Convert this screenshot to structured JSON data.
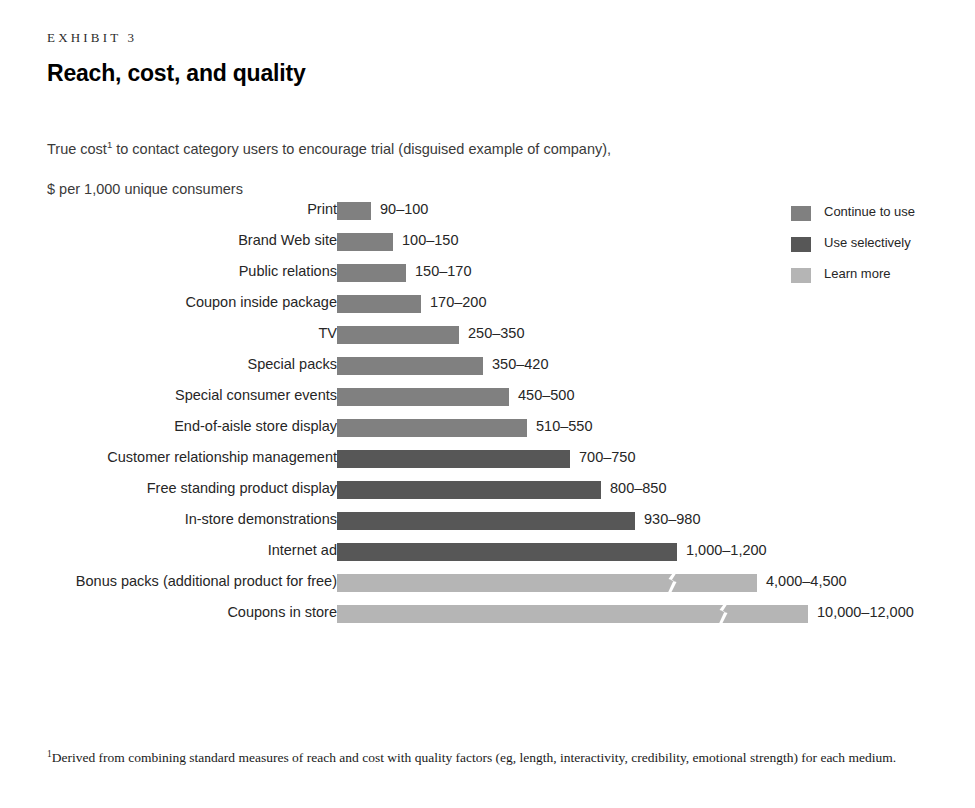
{
  "header": {
    "exhibit_label": "EXHIBIT 3",
    "title": "Reach, cost, and quality",
    "subtitle_line1_pre": "True cost",
    "subtitle_superscript": "1",
    "subtitle_line1_post": " to contact category users to encourage trial (disguised example of company),",
    "subtitle_line2": "$ per 1,000 unique consumers"
  },
  "footnote": {
    "superscript": "1",
    "text": "Derived from combining standard measures of reach and cost with quality factors (eg, length, interactivity, credibility, emotional strength) for each medium."
  },
  "legend": {
    "position": "top-right",
    "items": [
      {
        "label": "Continue to use",
        "color": "#808080"
      },
      {
        "label": "Use selectively",
        "color": "#575757"
      },
      {
        "label": "Learn more",
        "color": "#b5b5b5"
      }
    ]
  },
  "chart_data": {
    "type": "bar",
    "orientation": "horizontal",
    "title": "Reach, cost, and quality",
    "subtitle": "True cost to contact category users to encourage trial (disguised example of company), $ per 1,000 unique consumers",
    "xlabel": "$ per 1,000 unique consumers",
    "ylabel": "",
    "grid": false,
    "axis_break": true,
    "axis_break_note": "Bars for Bonus packs and Coupons in store are drawn with a broken (zigzag) axis because their values far exceed the others.",
    "legend_position": "top-right",
    "categories": [
      "Print",
      "Brand Web site",
      "Public relations",
      "Coupon inside package",
      "TV",
      "Special packs",
      "Special consumer events",
      "End-of-aisle store display",
      "Customer relationship management",
      "Free standing product display",
      "In-store demonstrations",
      "Internet ad",
      "Bonus packs (additional product for free)",
      "Coupons in store"
    ],
    "value_labels": [
      "90–100",
      "100–150",
      "150–170",
      "170–200",
      "250–350",
      "350–420",
      "450–500",
      "510–550",
      "700–750",
      "800–850",
      "930–980",
      "1,000–1,200",
      "4,000–4,500",
      "10,000–12,000"
    ],
    "low_values": [
      90,
      100,
      150,
      170,
      250,
      350,
      450,
      510,
      700,
      800,
      930,
      1000,
      4000,
      10000
    ],
    "high_values": [
      100,
      150,
      170,
      200,
      350,
      420,
      500,
      550,
      750,
      850,
      980,
      1200,
      4500,
      12000
    ],
    "series_assignment": [
      "Continue to use",
      "Continue to use",
      "Continue to use",
      "Continue to use",
      "Continue to use",
      "Continue to use",
      "Continue to use",
      "Continue to use",
      "Use selectively",
      "Use selectively",
      "Use selectively",
      "Use selectively",
      "Learn more",
      "Learn more"
    ],
    "bar_pixel_widths": [
      34,
      56,
      69,
      84,
      122,
      146,
      172,
      190,
      233,
      264,
      298,
      340,
      420,
      471
    ],
    "bar_break_offsets": [
      null,
      null,
      null,
      null,
      null,
      null,
      null,
      null,
      null,
      null,
      null,
      null,
      335,
      386
    ]
  }
}
